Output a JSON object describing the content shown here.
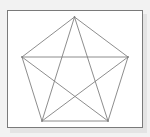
{
  "diagram": {
    "title": "",
    "type": "complete-graph-pentagon",
    "colors": {
      "background": "#f2f2f2",
      "frame_fill": "#ffffff",
      "frame_border": "#7a7a7a",
      "edge": "#808080"
    },
    "vertices": [
      {
        "id": "top",
        "x": 74.5,
        "y": 17
      },
      {
        "id": "right",
        "x": 128,
        "y": 57
      },
      {
        "id": "bottom-right",
        "x": 108,
        "y": 121
      },
      {
        "id": "bottom-left",
        "x": 42,
        "y": 121
      },
      {
        "id": "left",
        "x": 22,
        "y": 57
      }
    ],
    "edges": [
      {
        "from": "top",
        "to": "right",
        "kind": "side"
      },
      {
        "from": "right",
        "to": "bottom-right",
        "kind": "side"
      },
      {
        "from": "bottom-right",
        "to": "bottom-left",
        "kind": "side"
      },
      {
        "from": "bottom-left",
        "to": "left",
        "kind": "side"
      },
      {
        "from": "left",
        "to": "top",
        "kind": "side"
      },
      {
        "from": "top",
        "to": "bottom-right",
        "kind": "diagonal"
      },
      {
        "from": "top",
        "to": "bottom-left",
        "kind": "diagonal"
      },
      {
        "from": "left",
        "to": "right",
        "kind": "diagonal"
      },
      {
        "from": "left",
        "to": "bottom-right",
        "kind": "diagonal"
      },
      {
        "from": "right",
        "to": "bottom-left",
        "kind": "diagonal"
      }
    ]
  }
}
